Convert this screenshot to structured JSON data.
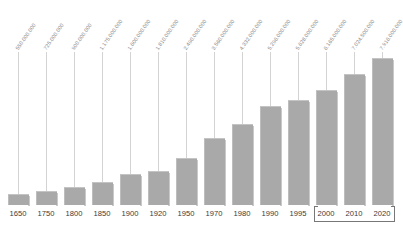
{
  "chart_data": {
    "type": "bar",
    "title": "",
    "subtitle": "",
    "xlabel": "",
    "ylabel": "",
    "grid": false,
    "legend": null,
    "ylim": [
      0,
      7916000000
    ],
    "categories": [
      "1650",
      "1750",
      "1800",
      "1850",
      "1900",
      "1920",
      "1950",
      "1970",
      "1980",
      "1990",
      "1995",
      "2000",
      "2010",
      "2020"
    ],
    "values": [
      550000000,
      725000000,
      900000000,
      1175000000,
      1600000000,
      1810000000,
      2490000000,
      3560000000,
      4332000000,
      5296000000,
      5628000000,
      6165000000,
      7024500000,
      7916000000
    ],
    "value_labels": [
      "550.000.000",
      "725.000.000",
      "900.000.000",
      "1.175.000.000",
      "1.600.000.000",
      "1.810.000.000",
      "2.490.000.000",
      "3.560.000.000",
      "4.332.000.000",
      "5.296.000.000",
      "5.628.000.000",
      "6.165.000.000",
      "7.024.500.000",
      "7.916.000.000"
    ],
    "annotations": [
      {
        "name": "projection-bracket",
        "from": "2000",
        "to": "2020"
      }
    ],
    "colors": {
      "bar": "#a9a9a9",
      "bar_top_edge": "#c4c4c4",
      "leader_line": "#d3d3d3",
      "value_label": "#8a8a8a",
      "year_label": "#3a3a3a",
      "bracket": "#777777",
      "background": "#ffffff"
    }
  }
}
